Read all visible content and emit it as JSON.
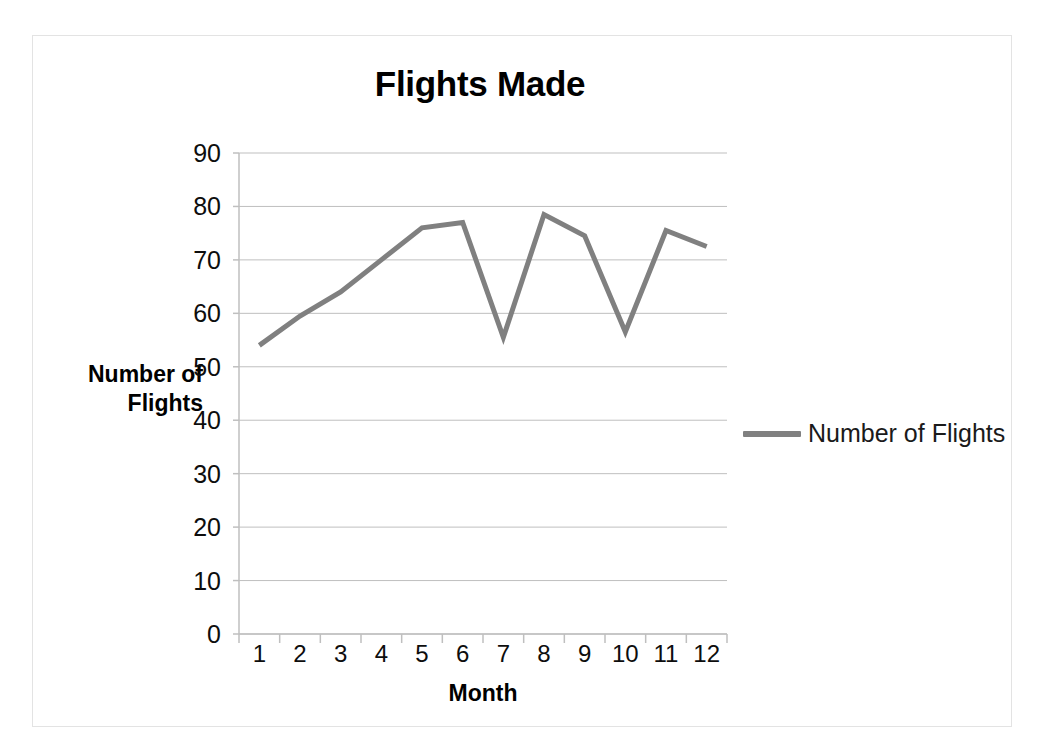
{
  "chart_data": {
    "type": "line",
    "title": "Flights Made",
    "xlabel": "Month",
    "ylabel": "Number of Flights",
    "categories": [
      "1",
      "2",
      "3",
      "4",
      "5",
      "6",
      "7",
      "8",
      "9",
      "10",
      "11",
      "12"
    ],
    "x": [
      1,
      2,
      3,
      4,
      5,
      6,
      7,
      8,
      9,
      10,
      11,
      12
    ],
    "series": [
      {
        "name": "Number of Flights",
        "values": [
          54,
          59.5,
          64,
          70,
          76,
          77,
          55.5,
          78.5,
          74.5,
          56.5,
          75.5,
          72.5
        ],
        "color": "#808080"
      }
    ],
    "ylim": [
      0,
      90
    ],
    "ytick_step": 10,
    "yticks": [
      0,
      10,
      20,
      30,
      40,
      50,
      60,
      70,
      80,
      90
    ],
    "ytick_labels": [
      "0",
      "10",
      "20",
      "30",
      "40",
      "50",
      "60",
      "70",
      "80",
      "90"
    ],
    "grid": true,
    "grid_axis": "y",
    "grid_color": "#bfbfbf",
    "axis_color": "#bfbfbf",
    "legend_position": "right",
    "legend_entries": [
      "Number of Flights"
    ],
    "markers": false,
    "line_width": 5
  },
  "colors": {
    "line": "#808080",
    "grid": "#bfbfbf",
    "axis": "#bfbfbf",
    "border": "#e3e3e3",
    "text": "#0d0d0d",
    "background": "#ffffff"
  }
}
